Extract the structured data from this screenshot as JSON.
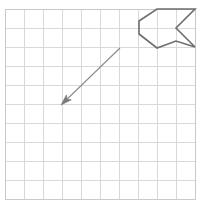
{
  "figure": {
    "canvas": {
      "width": 200,
      "height": 211,
      "background": "#ffffff"
    },
    "grid": {
      "label": "square grid",
      "origin_x": 5,
      "origin_y": 9,
      "cell_size": 19,
      "columns": 10,
      "rows": 10,
      "line_color": "#d9d9d9",
      "border_color": "#c9c9c9",
      "show_grid": true
    },
    "shape": {
      "label": "arrow-notch polygon",
      "stroke_color": "#6e6e6e",
      "stroke_width": 1.6,
      "fill": "none",
      "closed": true,
      "vertices": [
        {
          "x": 139,
          "y": 21
        },
        {
          "x": 157,
          "y": 9
        },
        {
          "x": 195,
          "y": 9
        },
        {
          "x": 176,
          "y": 28
        },
        {
          "x": 195,
          "y": 47
        },
        {
          "x": 176,
          "y": 41
        },
        {
          "x": 157,
          "y": 48
        },
        {
          "x": 139,
          "y": 34
        }
      ]
    },
    "vector": {
      "label": "translation arrow",
      "stroke_color": "#8a8a8a",
      "head_color": "#7a7a7a",
      "tail": {
        "x": 120,
        "y": 48
      },
      "tip": {
        "x": 61,
        "y": 105
      },
      "direction": "down-left",
      "head_length": 11,
      "head_width": 7
    }
  }
}
